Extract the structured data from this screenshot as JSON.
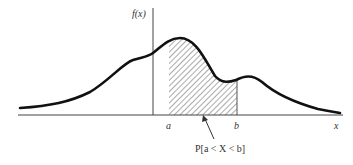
{
  "diagram": {
    "y_axis_label": "f(x)",
    "x_axis_label": "x",
    "interval_start_label": "a",
    "interval_end_label": "b",
    "shaded_region_label": "P[a < X < b]",
    "curve_color": "#111111",
    "hatch_color": "#555555"
  }
}
